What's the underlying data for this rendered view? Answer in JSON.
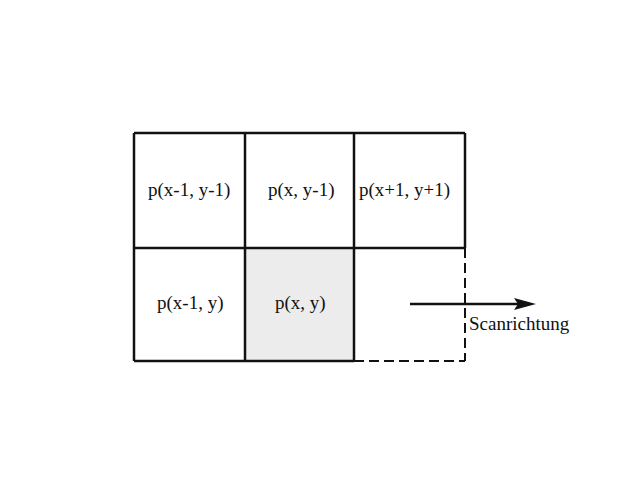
{
  "diagram": {
    "type": "pixel-neighborhood-grid",
    "cells": {
      "top_left": "p(x-1, y-1)",
      "top_center": "p(x, y-1)",
      "top_right": "p(x+1, y+1)",
      "middle_left": "p(x-1, y)",
      "current": "p(x, y)"
    },
    "arrow_label": "Scanrichtung",
    "colors": {
      "line": "#111111",
      "current_fill": "#ececec",
      "background": "#ffffff"
    }
  }
}
